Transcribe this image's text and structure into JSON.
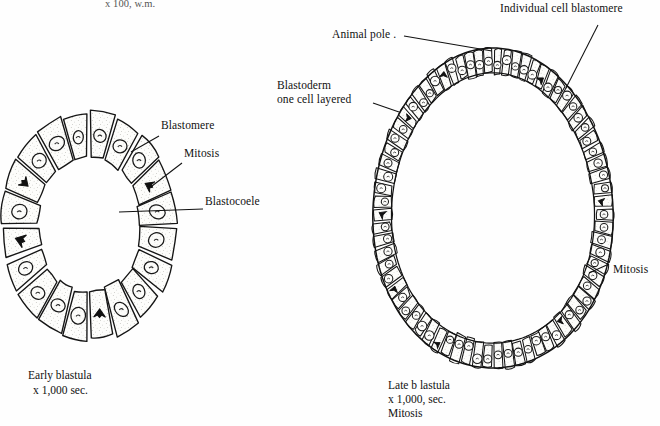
{
  "page": {
    "width": 660,
    "height": 426,
    "background": "#fefefe",
    "ink": "#111111",
    "figure_title_clipped": "x 100, w.m."
  },
  "left_figure": {
    "name": "early-blastula",
    "caption_line1": "Early blastula",
    "caption_line2": "x 1,000 sec.",
    "labels": [
      {
        "id": "blastomere",
        "text": "Blastomere"
      },
      {
        "id": "mitosis",
        "text": "Mitosis"
      },
      {
        "id": "blastocoele",
        "text": "Blastocoele"
      }
    ],
    "cell_count": 20,
    "shape": "ring"
  },
  "right_figure": {
    "name": "late-blastula",
    "caption_line1": "Late b lastula",
    "caption_line2": "x 1,000, sec.",
    "caption_line3": "Mitosis",
    "labels": [
      {
        "id": "individual-cell-blastomere",
        "text": "Individual cell blastomere"
      },
      {
        "id": "animal-pole",
        "text": "Animal pole ."
      },
      {
        "id": "blastoderm",
        "text": "Blastoderm\none cell layered"
      },
      {
        "id": "mitosis",
        "text": "Mitosis"
      }
    ],
    "cell_count": 72,
    "shape": "ovoid"
  },
  "chart_data": {
    "type": "diagram",
    "figures": [
      {
        "name": "Early blastula",
        "magnification": "x 1,000 sec.",
        "outline": "ring",
        "blastomere_count": 20,
        "annotations": [
          "Blastomere",
          "Mitosis",
          "Blastocoele"
        ]
      },
      {
        "name": "Late b lastula",
        "magnification": "x 1,000, sec.",
        "outline": "ovoid",
        "blastomere_count": 72,
        "annotations": [
          "Individual cell blastomere",
          "Animal pole .",
          "Blastoderm one cell layered",
          "Mitosis"
        ]
      }
    ]
  }
}
